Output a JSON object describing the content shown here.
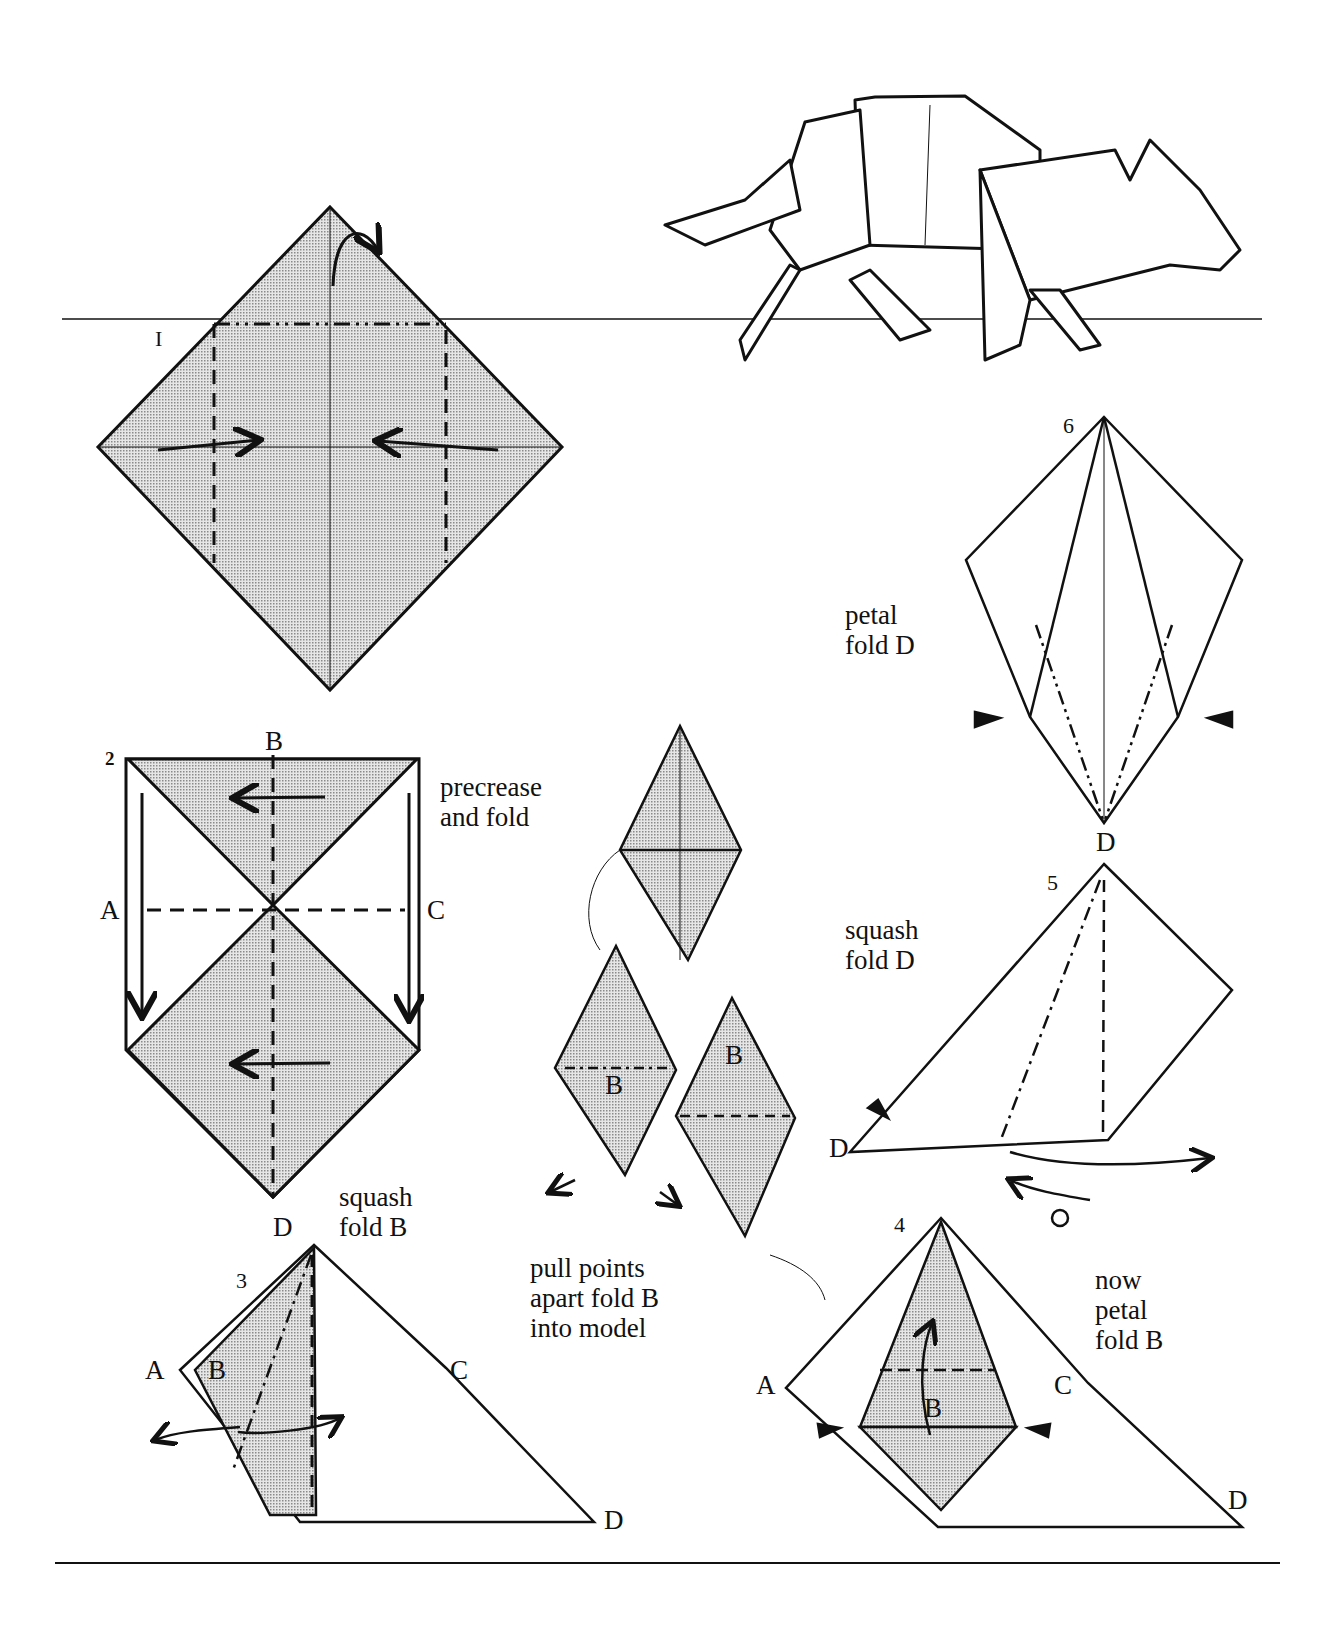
{
  "diagram": {
    "steps": [
      {
        "number": "I",
        "instruction": ""
      },
      {
        "number": "2",
        "instruction": "precrease\nand fold"
      },
      {
        "number": "3",
        "instruction": "squash\nfold B"
      },
      {
        "number": "4",
        "instruction": "now\npetal\nfold B"
      },
      {
        "number": "5",
        "instruction": "squash\nfold D"
      },
      {
        "number": "6",
        "instruction": "petal\nfold D"
      }
    ],
    "intermediate_instruction": "pull points\napart fold B\ninto model",
    "point_labels": {
      "a": "A",
      "b": "B",
      "c": "C",
      "d": "D"
    },
    "colors": {
      "paper_shaded": "#c9c9c9",
      "ink": "#111111",
      "background": "#ffffff"
    }
  }
}
